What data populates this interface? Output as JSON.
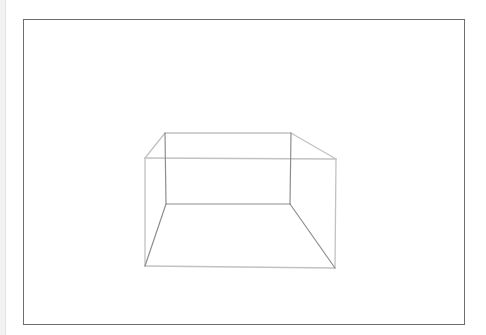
{
  "drawing": {
    "subject": "Box in one-point perspective",
    "frame": {
      "x": 23,
      "y": 19,
      "width": 441,
      "height": 305,
      "stroke": "#6e6e6e"
    },
    "colors": {
      "background": "#ffffff",
      "light_line": "#bdbdbd",
      "dark_line": "#8a8a8a"
    },
    "box": {
      "front_top_left": [
        145,
        158
      ],
      "front_top_right": [
        336,
        159
      ],
      "front_bottom_left": [
        145,
        266
      ],
      "front_bottom_right": [
        335,
        268
      ],
      "back_top_left": [
        165,
        133
      ],
      "back_top_right": [
        291,
        133
      ],
      "back_bottom_left": [
        166,
        204
      ],
      "back_bottom_right": [
        290,
        204
      ]
    }
  }
}
